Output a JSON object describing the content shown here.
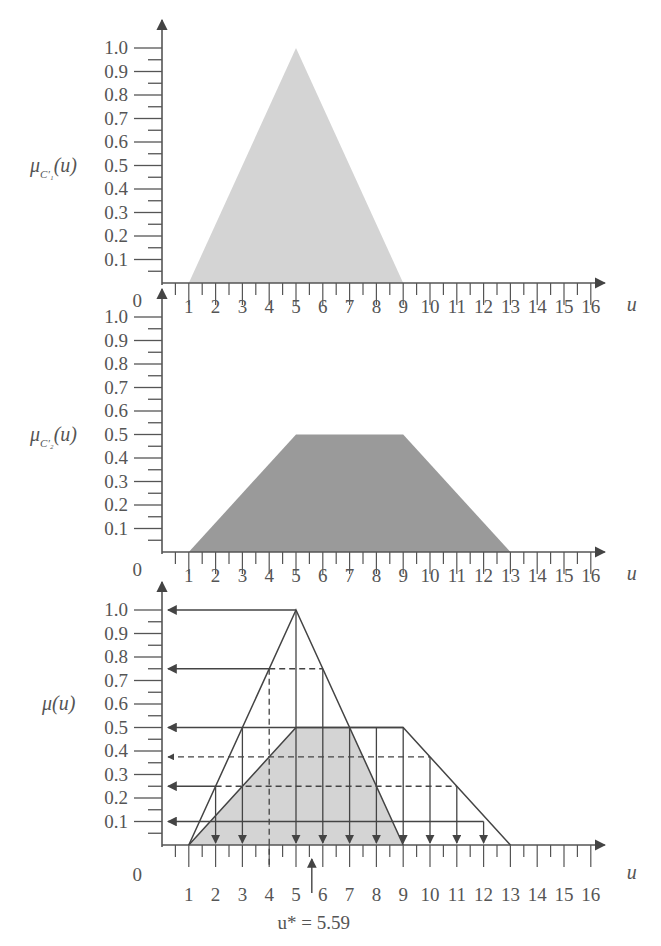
{
  "chart_data": [
    {
      "type": "area",
      "panel": "top",
      "ylabel": "μ_C1'(u)",
      "xlabel": "u",
      "ylim": [
        0,
        1.0
      ],
      "xlim": [
        0,
        16
      ],
      "x_ticks": [
        1,
        2,
        3,
        4,
        5,
        6,
        7,
        8,
        9,
        10,
        11,
        12,
        13,
        14,
        15,
        16
      ],
      "y_ticks": [
        "0.1",
        "0.2",
        "0.3",
        "0.4",
        "0.5",
        "0.6",
        "0.7",
        "0.8",
        "0.9",
        "1.0"
      ],
      "origin_label": "0",
      "shape": "triangle",
      "points": [
        [
          1,
          0
        ],
        [
          5,
          1.0
        ],
        [
          9,
          0
        ]
      ],
      "fill": "#d4d4d4"
    },
    {
      "type": "area",
      "panel": "middle",
      "ylabel": "μ_C2'(u)",
      "xlabel": "u",
      "ylim": [
        0,
        1.0
      ],
      "xlim": [
        0,
        16
      ],
      "x_ticks": [
        1,
        2,
        3,
        4,
        5,
        6,
        7,
        8,
        9,
        10,
        11,
        12,
        13,
        14,
        15,
        16
      ],
      "y_ticks": [
        "0.1",
        "0.2",
        "0.3",
        "0.4",
        "0.5",
        "0.6",
        "0.7",
        "0.8",
        "0.9",
        "1.0"
      ],
      "origin_label": "0",
      "shape": "trapezoid",
      "points": [
        [
          1,
          0
        ],
        [
          5,
          0.5
        ],
        [
          9,
          0.5
        ],
        [
          13,
          0
        ]
      ],
      "fill": "#9a9a9a"
    },
    {
      "type": "line",
      "panel": "bottom",
      "ylabel": "μ(u)",
      "xlabel": "u",
      "ylim": [
        0,
        1.0
      ],
      "xlim": [
        0,
        16
      ],
      "x_ticks": [
        1,
        2,
        3,
        4,
        5,
        6,
        7,
        8,
        9,
        10,
        11,
        12,
        13,
        14,
        15,
        16
      ],
      "y_ticks": [
        "0.1",
        "0.2",
        "0.3",
        "0.4",
        "0.5",
        "0.6",
        "0.7",
        "0.8",
        "0.9",
        "1.0"
      ],
      "origin_label": "0",
      "series": [
        {
          "name": "C1' triangle outline",
          "points": [
            [
              1,
              0
            ],
            [
              5,
              1.0
            ],
            [
              9,
              0
            ]
          ]
        },
        {
          "name": "C2' trapezoid outline",
          "points": [
            [
              1,
              0
            ],
            [
              5,
              0.5
            ],
            [
              9,
              0.5
            ],
            [
              13,
              0
            ]
          ]
        }
      ],
      "shaded_region": {
        "points": [
          [
            1,
            0
          ],
          [
            5,
            0.5
          ],
          [
            7,
            0.5
          ],
          [
            9,
            0
          ]
        ],
        "fill": "#d4d4d4"
      },
      "horizontal_arrows_to_axis": [
        {
          "y": 1.0,
          "from_x": 5,
          "style": "solid"
        },
        {
          "y": 0.75,
          "from_x": 4,
          "to_x_dashed": 6,
          "style": "solid-then-dashed"
        },
        {
          "y": 0.5,
          "from_x": 3,
          "to_x": 9,
          "style": "solid"
        },
        {
          "y": 0.375,
          "to_x": 10,
          "style": "dashed"
        },
        {
          "y": 0.25,
          "from_x": 2,
          "to_x": 11,
          "style": "solid-then-dashed"
        },
        {
          "y": 0.1,
          "to_x": 12,
          "style": "solid"
        }
      ],
      "vertical_arrows_down": [
        2,
        3,
        5,
        6,
        7,
        8,
        9,
        10,
        11,
        12
      ],
      "vertical_dashed": [
        4
      ],
      "defuzzified": {
        "label": "u* = 5.59",
        "value": 5.59
      }
    }
  ],
  "labels": {
    "u": "u",
    "mu_top": "μ",
    "mu_top_sub": "C′₁",
    "mu_mid": "μ",
    "mu_mid_sub": "C′₂",
    "mu_bottom": "μ(u)",
    "paren_u": "(u)",
    "origin": "0",
    "result": "u* = 5.59"
  }
}
